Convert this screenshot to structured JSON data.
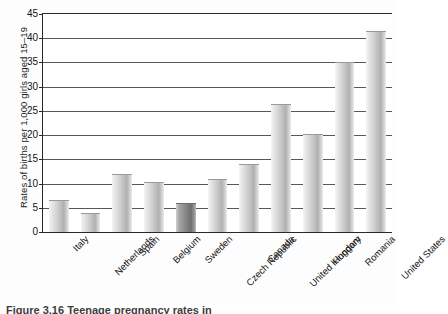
{
  "figure": {
    "caption_cropped": "Figure 3.16   Teenage pregnancy rates in"
  },
  "chart_data": {
    "type": "bar",
    "title": "",
    "xlabel": "",
    "ylabel": "Rates of births per 1,000 girls aged 15–19",
    "ylim": [
      0,
      45
    ],
    "ytick_step": 5,
    "grid": true,
    "legend": "none",
    "orientation": "vertical",
    "categories": [
      "Italy",
      "Netherlands",
      "Spain",
      "Belgium",
      "Sweden",
      "Czech Republic",
      "Canada",
      "United Kingdom",
      "Hungary",
      "Romania",
      "United States"
    ],
    "values": [
      6.7,
      4.0,
      12.0,
      10.3,
      6.0,
      11.0,
      14.0,
      26.5,
      20.2,
      35.0,
      41.5
    ],
    "ytick_labels": [
      "0",
      "5",
      "10",
      "15",
      "20",
      "25",
      "30",
      "35",
      "40",
      "45"
    ],
    "bar_styles": [
      "light",
      "light",
      "light",
      "light",
      "dark",
      "light",
      "light",
      "light",
      "light",
      "light",
      "light"
    ],
    "colors": {
      "bar_light_face": "#c9c9c9",
      "bar_dark_face": "#8a8a8a",
      "axis": "#2a2a2a",
      "gridline": "#3a3a3a",
      "background": "#ffffff",
      "text": "#161616"
    }
  }
}
